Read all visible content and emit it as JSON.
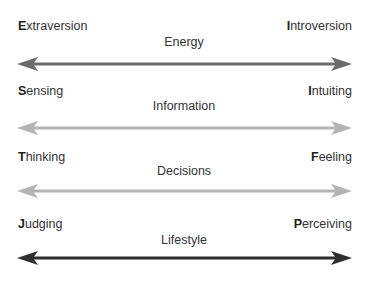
{
  "dimensions": [
    {
      "name": "Energy",
      "left": {
        "initial": "E",
        "rest": "xtraversion"
      },
      "right": {
        "initial": "I",
        "rest": "ntroversion"
      },
      "arrow_color": "#6b6b6b"
    },
    {
      "name": "Information",
      "left": {
        "initial": "S",
        "rest": "ensing"
      },
      "right": {
        "initial": "I",
        "rest": "ntuiting"
      },
      "arrow_color": "#b4b4b4"
    },
    {
      "name": "Decisions",
      "left": {
        "initial": "T",
        "rest": "hinking"
      },
      "right": {
        "initial": "F",
        "rest": "eeling"
      },
      "arrow_color": "#b4b4b4"
    },
    {
      "name": "Lifestyle",
      "left": {
        "initial": "J",
        "rest": "udging"
      },
      "right": {
        "initial": "P",
        "rest": "erceiving"
      },
      "arrow_color": "#2e2e2e"
    }
  ]
}
